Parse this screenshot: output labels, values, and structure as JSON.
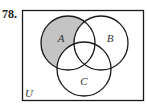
{
  "problem": {
    "number": "78."
  },
  "diagram": {
    "type": "venn",
    "universe_label": "U",
    "sets": [
      {
        "label": "A",
        "cx": 68,
        "cy": 43,
        "r": 27,
        "label_x": 61,
        "label_y": 42
      },
      {
        "label": "B",
        "cx": 101,
        "cy": 43,
        "r": 27,
        "label_x": 110,
        "label_y": 42
      },
      {
        "label": "C",
        "cx": 84,
        "cy": 69,
        "r": 27,
        "label_x": 84,
        "label_y": 85
      }
    ],
    "shaded_region": "A only (A minus B union C)",
    "colors": {
      "shade": "#c4c4c4",
      "stroke": "#1a1a1a",
      "background": "#ffffff"
    }
  }
}
